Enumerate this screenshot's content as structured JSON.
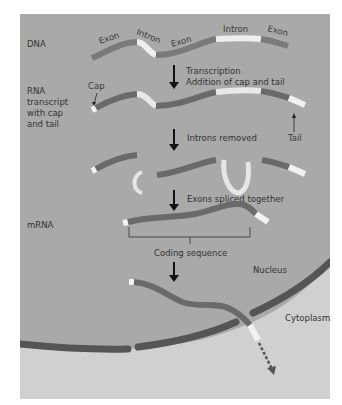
{
  "colors": {
    "nucleus_bg": "#a8a8a8",
    "cytoplasm_bg": "#cfcfcf",
    "exon": "#6a6a6a",
    "intron": "#ececec",
    "cap_tail": "#f2f2f2",
    "membrane": "#555555",
    "arrow": "#111111",
    "text": "#333333"
  },
  "stages": {
    "dna": "DNA",
    "rna_transcript": [
      "RNA",
      "transcript",
      "with cap",
      "and tail"
    ],
    "mrna": "mRNA"
  },
  "dna_segments": [
    "Exon",
    "Intron",
    "Exon",
    "Intron",
    "Exon"
  ],
  "steps": {
    "transcription": "Transcription",
    "addition": "Addition of cap and tail",
    "introns_removed": "Introns removed",
    "exons_spliced": "Exons spliced together"
  },
  "annotations": {
    "cap": "Cap",
    "tail": "Tail",
    "coding_sequence": "Coding sequence",
    "nucleus": "Nucleus",
    "cytoplasm": "Cytoplasm"
  }
}
